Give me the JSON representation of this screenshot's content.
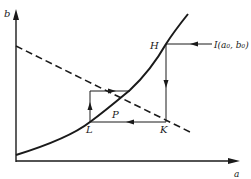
{
  "diagram": {
    "axes": {
      "x_label": "a",
      "y_label": "b"
    },
    "points": {
      "H": "H",
      "K": "K",
      "L": "L",
      "P": "P",
      "I": "I(a₀, b₀)"
    },
    "curves": [
      {
        "name": "solid-curve",
        "style": "solid",
        "description": "increasing convex curve from lower-left to upper-right"
      },
      {
        "name": "dashed-line",
        "style": "dashed",
        "description": "decreasing line from upper-left to lower-right"
      }
    ],
    "path": [
      "I",
      "H",
      "K",
      "L",
      "up",
      "right-to-curve"
    ],
    "colors": {
      "ink": "#1a1a1a",
      "background": "#ffffff"
    }
  }
}
